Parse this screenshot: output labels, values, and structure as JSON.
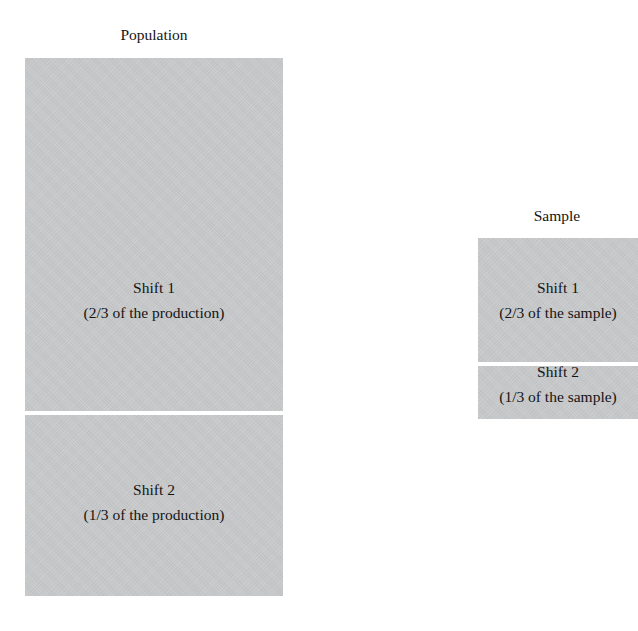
{
  "figure": {
    "background_color": "#ffffff",
    "block_fill_color": "#c8c9ca",
    "divider_color": "#ffffff",
    "text_color": "#141414"
  },
  "groups": [
    {
      "id": "population",
      "title": "Population",
      "segments": [
        {
          "name": "Shift 1",
          "proportion_text": "(2/3 of the production)",
          "fraction": "2/3"
        },
        {
          "name": "Shift 2",
          "proportion_text": "(1/3 of the production)",
          "fraction": "1/3"
        }
      ]
    },
    {
      "id": "sample",
      "title": "Sample",
      "segments": [
        {
          "name": "Shift 1",
          "proportion_text": "(2/3 of the sample)",
          "fraction": "2/3"
        },
        {
          "name": "Shift 2",
          "proportion_text": "(1/3 of the sample)",
          "fraction": "1/3"
        }
      ]
    }
  ],
  "chart_data": {
    "type": "bar",
    "title": "",
    "xlabel": "",
    "ylabel": "",
    "categories": [
      "Population",
      "Sample"
    ],
    "series": [
      {
        "name": "Shift 1",
        "values": [
          0.6667,
          0.6667
        ]
      },
      {
        "name": "Shift 2",
        "values": [
          0.3333,
          0.3333
        ]
      }
    ],
    "annotations": [
      "Population — Shift 1 (2/3 of the production)",
      "Population — Shift 2 (1/3 of the production)",
      "Sample — Shift 1 (2/3 of the sample)",
      "Sample — Shift 2 (1/3 of the sample)"
    ],
    "grid": false,
    "legend": "none"
  }
}
